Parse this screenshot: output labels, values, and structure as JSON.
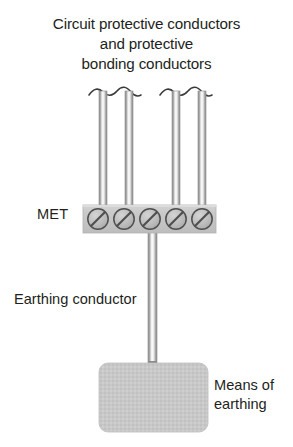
{
  "diagram": {
    "title_lines": [
      "Circuit protective conductors",
      "and protective",
      "bonding conductors"
    ],
    "labels": {
      "met": "MET",
      "earthing_conductor": "Earthing conductor",
      "means_of_earthing_line1": "Means of",
      "means_of_earthing_line2": "earthing"
    },
    "colors": {
      "text": "#231f20",
      "background": "#ffffff",
      "terminal_block_fill": "#c9c9c9",
      "terminal_block_edge": "#b0b0b0",
      "screw_fill": "#bdbdbd",
      "screw_edge": "#5f5f5f",
      "conductor_edge": "#9a9a9a",
      "conductor_core": "#efefef",
      "means_box_fill": "#c6c6c6",
      "wave_stroke": "#3a3a3a"
    },
    "terminal_block": {
      "name": "MET",
      "screw_count": 5,
      "screw_labels": [
        "terminal-1",
        "terminal-2",
        "terminal-3",
        "terminal-4",
        "terminal-5"
      ],
      "occupied_terminals": [
        1,
        2,
        4,
        5
      ],
      "downward_terminal": 3
    },
    "incoming_conductors": {
      "count": 4,
      "pairs": 2,
      "break_style": "wavy"
    },
    "means_of_earthing": {
      "shape": "rounded-rectangle"
    }
  }
}
